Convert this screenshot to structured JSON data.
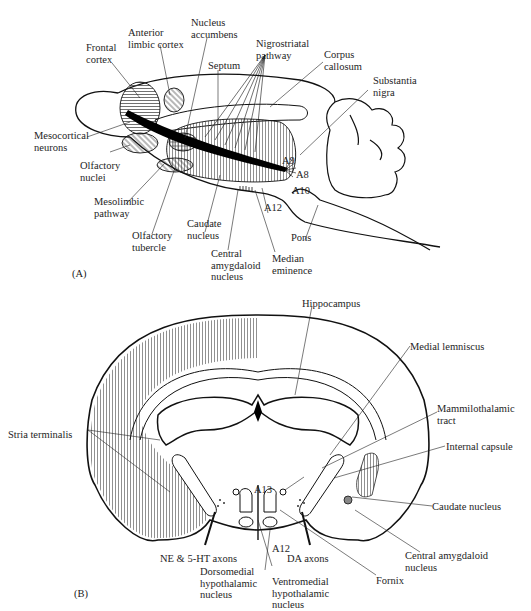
{
  "figure": {
    "panel_a": {
      "tag": "(A)",
      "labels": {
        "frontal_cortex": "Frontal\ncortex",
        "anterior_limbic_cortex": "Anterior\nlimbic cortex",
        "nucleus_accumbens": "Nucleus\naccumbens",
        "nigrostriatal_pathway": "Nigrostriatal\npathway",
        "septum": "Septum",
        "corpus_callosum": "Corpus\ncallosum",
        "substantia_nigra": "Substantia\nnigra",
        "mesocortical_neurons": "Mesocortical\nneurons",
        "olfactory_nuclei": "Olfactory\nnuclei",
        "mesolimbic_pathway": "Mesolimbic\npathway",
        "olfactory_tubercle": "Olfactory\ntubercle",
        "caudate_nucleus": "Caudate\nnucleus",
        "central_amygdaloid_nucleus": "Central\namygdaloid\nnucleus",
        "median_eminence": "Median\neminence",
        "pons": "Pons",
        "a9": "A9",
        "a8": "A8",
        "a10": "A10",
        "a12": "A12"
      }
    },
    "panel_b": {
      "tag": "(B)",
      "labels": {
        "hippocampus": "Hippocampus",
        "medial_lemniscus": "Medial lemniscus",
        "mammilothalamic_tract": "Mammilothalamic\ntract",
        "stria_terminalis": "Stria terminalis",
        "internal_capsule": "Internal capsule",
        "caudate_nucleus": "Caudate nucleus",
        "central_amygdaloid_nucleus": "Central amygdaloid\nnucleus",
        "fornix": "Fornix",
        "a13": "A13",
        "a12": "A12",
        "ne_5ht_axons": "NE & 5-HT axons",
        "da_axons": "DA axons",
        "dorsomedial_hypothalamic_nucleus": "Dorsomedial\nhypothalamic\nnucleus",
        "ventromedial_hypothalamic_nucleus": "Ventromedial\nhypothalamic\nnucleus"
      }
    }
  }
}
